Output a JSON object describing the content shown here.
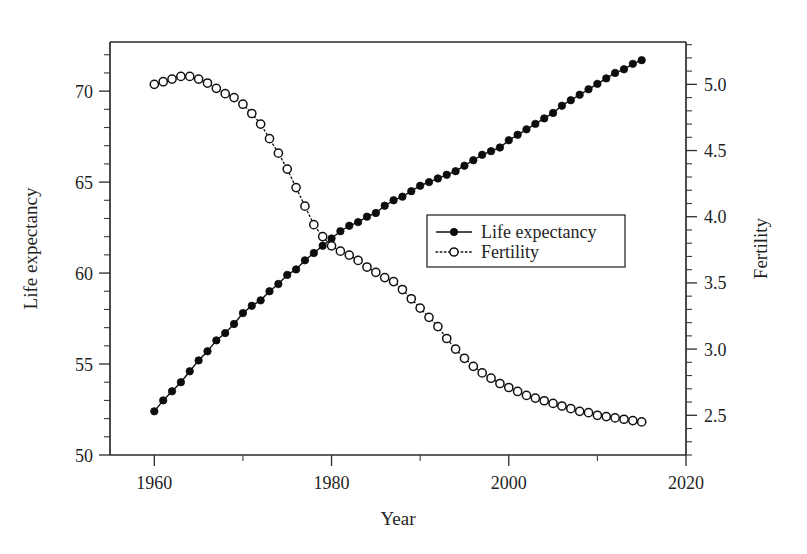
{
  "chart_data": {
    "type": "line",
    "title": "",
    "xlabel": "Year",
    "ylabel": "Life expectancy",
    "y2label": "Fertility",
    "xlim": [
      1955,
      2020
    ],
    "ylim": [
      50,
      72.7
    ],
    "y2lim": [
      2.2,
      5.32
    ],
    "grid": false,
    "legend_position": "center-right",
    "xticks": [
      1960,
      1980,
      2000,
      2020
    ],
    "xtick_labels": [
      "1960",
      "1980",
      "2000",
      "2020"
    ],
    "x_minor_ticks": [
      1970,
      1990,
      2010
    ],
    "yticks": [
      50,
      55,
      60,
      65,
      70
    ],
    "ytick_labels": [
      "50",
      "55",
      "60",
      "65",
      "70"
    ],
    "y_minor_step": 1,
    "y2ticks": [
      2.5,
      3.0,
      3.5,
      4.0,
      4.5,
      5.0
    ],
    "y2tick_labels": [
      "2.5",
      "3.0",
      "3.5",
      "4.0",
      "4.5",
      "5.0"
    ],
    "y2_minor_step": 0.1,
    "x": [
      1960,
      1961,
      1962,
      1963,
      1964,
      1965,
      1966,
      1967,
      1968,
      1969,
      1970,
      1971,
      1972,
      1973,
      1974,
      1975,
      1976,
      1977,
      1978,
      1979,
      1980,
      1981,
      1982,
      1983,
      1984,
      1985,
      1986,
      1987,
      1988,
      1989,
      1990,
      1991,
      1992,
      1993,
      1994,
      1995,
      1996,
      1997,
      1998,
      1999,
      2000,
      2001,
      2002,
      2003,
      2004,
      2005,
      2006,
      2007,
      2008,
      2009,
      2010,
      2011,
      2012,
      2013,
      2014,
      2015
    ],
    "series": [
      {
        "name": "Life expectancy",
        "axis": "left",
        "marker": "filled-circle",
        "linestyle": "solid",
        "color": "#0d0d0d",
        "values": [
          52.4,
          53.0,
          53.5,
          54.0,
          54.6,
          55.2,
          55.7,
          56.3,
          56.7,
          57.2,
          57.8,
          58.2,
          58.5,
          59.0,
          59.4,
          59.9,
          60.2,
          60.7,
          61.1,
          61.5,
          61.9,
          62.3,
          62.6,
          62.8,
          63.1,
          63.3,
          63.7,
          64.0,
          64.2,
          64.5,
          64.8,
          65.0,
          65.2,
          65.4,
          65.6,
          65.9,
          66.2,
          66.5,
          66.7,
          66.9,
          67.3,
          67.6,
          67.9,
          68.2,
          68.5,
          68.8,
          69.2,
          69.5,
          69.8,
          70.1,
          70.4,
          70.7,
          71.0,
          71.2,
          71.5,
          71.7
        ]
      },
      {
        "name": "Fertility",
        "axis": "right",
        "marker": "open-circle",
        "linestyle": "dotted",
        "color": "#111111",
        "values": [
          5.0,
          5.02,
          5.04,
          5.06,
          5.06,
          5.04,
          5.01,
          4.97,
          4.93,
          4.9,
          4.85,
          4.78,
          4.7,
          4.59,
          4.48,
          4.36,
          4.22,
          4.08,
          3.94,
          3.85,
          3.78,
          3.74,
          3.71,
          3.67,
          3.62,
          3.58,
          3.54,
          3.51,
          3.45,
          3.38,
          3.31,
          3.24,
          3.17,
          3.08,
          3.0,
          2.93,
          2.87,
          2.82,
          2.78,
          2.74,
          2.71,
          2.68,
          2.65,
          2.63,
          2.61,
          2.59,
          2.57,
          2.55,
          2.53,
          2.52,
          2.5,
          2.49,
          2.48,
          2.47,
          2.46,
          2.45
        ]
      }
    ]
  },
  "legend": {
    "entries": [
      {
        "label": "Life expectancy"
      },
      {
        "label": "Fertility"
      }
    ]
  }
}
